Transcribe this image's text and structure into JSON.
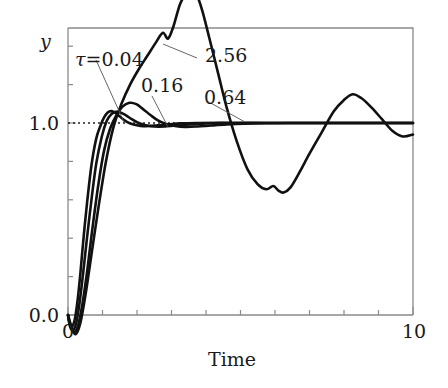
{
  "figure": {
    "title": "",
    "background_color": "#ffffff",
    "curve_color": "#111111",
    "axis_color": "#8a8a8a"
  },
  "axes": {
    "x_label": "Time",
    "y_label": "y",
    "x_ticks": [
      "0",
      "10"
    ],
    "x_tick_values": [
      0,
      10
    ],
    "y_ticks": [
      "0.0",
      "1.0"
    ],
    "y_tick_values": [
      0.0,
      1.0
    ],
    "x_minor_tick_count": 10,
    "y_minor_tick_count": 8,
    "reference_line_value": "1.0"
  },
  "annotations": {
    "tau_prefix": "τ=",
    "label_tau_004": "0.04",
    "label_tau_016": "0.16",
    "label_tau_064": "0.64",
    "label_tau_256": "2.56"
  },
  "chart_data": {
    "type": "line",
    "title": "",
    "xlabel": "Time",
    "ylabel": "y",
    "xlim": [
      0,
      10
    ],
    "ylim": [
      -0.08,
      1.72
    ],
    "grid": false,
    "legend": "inline-annotations",
    "reference_lines": [
      {
        "axis": "y",
        "value": 1.0,
        "style": "dotted",
        "label": "1.0"
      }
    ],
    "series": [
      {
        "name": "τ = 0.04",
        "tau": 0.04,
        "x": [
          0.0,
          0.05,
          0.12,
          0.2,
          0.28,
          0.36,
          0.45,
          0.55,
          0.68,
          0.82,
          0.95,
          1.05,
          1.15,
          1.25,
          1.35,
          1.45,
          1.58,
          1.72,
          1.9,
          2.1,
          2.35,
          2.6,
          2.9,
          3.3,
          3.8,
          4.4,
          5.2,
          6.0,
          7.0,
          8.0,
          9.0,
          10.0
        ],
        "y": [
          0.0,
          -0.05,
          -0.06,
          -0.02,
          0.08,
          0.22,
          0.4,
          0.58,
          0.78,
          0.92,
          0.99,
          1.03,
          1.055,
          1.062,
          1.055,
          1.042,
          1.022,
          1.005,
          0.992,
          0.985,
          0.984,
          0.988,
          0.993,
          0.998,
          1.0,
          1.001,
          1.0,
          1.0,
          1.0,
          1.0,
          1.0,
          1.0
        ]
      },
      {
        "name": "τ = 0.16",
        "tau": 0.16,
        "x": [
          0.0,
          0.06,
          0.14,
          0.24,
          0.34,
          0.44,
          0.55,
          0.68,
          0.82,
          0.98,
          1.12,
          1.25,
          1.38,
          1.52,
          1.68,
          1.85,
          2.05,
          2.25,
          2.5,
          2.8,
          3.1,
          3.5,
          4.0,
          4.6,
          5.3,
          6.1,
          7.0,
          8.0,
          9.0,
          10.0
        ],
        "y": [
          0.0,
          -0.06,
          -0.08,
          -0.04,
          0.07,
          0.22,
          0.4,
          0.6,
          0.79,
          0.93,
          1.01,
          1.045,
          1.058,
          1.055,
          1.04,
          1.02,
          1.0,
          0.988,
          0.982,
          0.982,
          0.987,
          0.993,
          0.998,
          1.0,
          1.001,
          1.0,
          1.0,
          1.0,
          1.0,
          1.0
        ]
      },
      {
        "name": "τ = 0.64",
        "tau": 0.64,
        "x": [
          0.0,
          0.08,
          0.18,
          0.3,
          0.42,
          0.55,
          0.7,
          0.88,
          1.05,
          1.22,
          1.4,
          1.58,
          1.78,
          1.98,
          2.18,
          2.4,
          2.62,
          2.85,
          3.1,
          3.4,
          3.75,
          4.15,
          4.6,
          5.1,
          5.7,
          6.4,
          7.2,
          8.1,
          9.0,
          10.0
        ],
        "y": [
          0.0,
          -0.06,
          -0.09,
          -0.05,
          0.06,
          0.22,
          0.44,
          0.68,
          0.86,
          0.97,
          1.04,
          1.085,
          1.105,
          1.098,
          1.072,
          1.04,
          1.012,
          0.995,
          0.985,
          0.98,
          0.982,
          0.987,
          0.992,
          0.996,
          0.999,
          1.0,
          1.0,
          1.0,
          1.0,
          1.0
        ]
      },
      {
        "name": "τ = 2.56",
        "tau": 2.56,
        "x": [
          0.0,
          0.1,
          0.22,
          0.36,
          0.52,
          0.7,
          0.9,
          1.1,
          1.32,
          1.55,
          1.8,
          2.05,
          2.3,
          2.55,
          2.75,
          2.9,
          3.05,
          3.25,
          3.45,
          3.6,
          3.75,
          3.9,
          4.1,
          4.35,
          4.6,
          4.9,
          5.2,
          5.5,
          5.75,
          5.95,
          6.1,
          6.25,
          6.45,
          6.7,
          7.0,
          7.35,
          7.7,
          8.0,
          8.25,
          8.5,
          8.8,
          9.1,
          9.4,
          9.7,
          10.0
        ],
        "y": [
          0.0,
          -0.06,
          -0.1,
          -0.04,
          0.12,
          0.34,
          0.58,
          0.8,
          0.98,
          1.1,
          1.2,
          1.28,
          1.35,
          1.42,
          1.47,
          1.44,
          1.5,
          1.62,
          1.68,
          1.7,
          1.66,
          1.58,
          1.44,
          1.26,
          1.08,
          0.9,
          0.76,
          0.68,
          0.655,
          0.672,
          0.648,
          0.638,
          0.665,
          0.74,
          0.84,
          0.95,
          1.06,
          1.12,
          1.15,
          1.13,
          1.08,
          1.02,
          0.96,
          0.93,
          0.94
        ]
      }
    ]
  },
  "annotation_leaders": [
    {
      "label": "0.04",
      "from": [
        96,
        60
      ],
      "to": [
        124,
        122
      ]
    },
    {
      "label": "0.16",
      "from": [
        152,
        96
      ],
      "to": [
        168,
        127
      ]
    },
    {
      "label": "0.64",
      "from": [
        207,
        101
      ],
      "to": [
        245,
        122
      ]
    },
    {
      "label": "2.56",
      "from": [
        197,
        58
      ],
      "to": [
        163,
        44
      ]
    }
  ]
}
